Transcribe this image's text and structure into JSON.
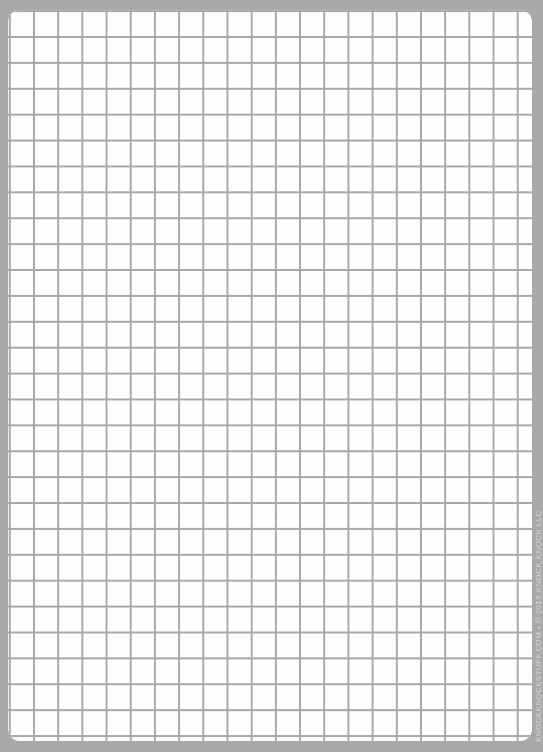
{
  "sheet": {
    "type": "graph-paper",
    "background_color": "#a9a9a9",
    "paper_color": "#fefefe",
    "grid_line_color": "#a8a8a8"
  },
  "credit": {
    "text": "KNOCKKNOCKSTUFF.COM • © 2015 KNOCK KNOCK LLC"
  }
}
